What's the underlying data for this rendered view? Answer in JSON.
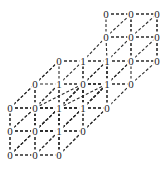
{
  "figure": {
    "kind": "lattice-graph",
    "projection": "oblique",
    "edge_color": "#2b2b2b",
    "node_color": "#1c1c1c",
    "background": "#ffffff",
    "dash_pattern": "3 2"
  },
  "geometry": {
    "origin_x": 10,
    "origin_y": 155,
    "step_x": 24.5,
    "step_y": -47,
    "step_zx": 24.5,
    "step_zy": -23.5,
    "nx": 3,
    "ny": 3,
    "nz": 3
  },
  "chart_data": {
    "type": "scatter",
    "title": "",
    "xlabel": "",
    "ylabel": "",
    "nodes": [
      {
        "id": "n000",
        "label": "0",
        "i": 0,
        "j": 0,
        "k": 0,
        "x": 10,
        "y": 155
      },
      {
        "id": "n100",
        "label": "0",
        "i": 1,
        "j": 0,
        "k": 0,
        "x": 35,
        "y": 155
      },
      {
        "id": "n200",
        "label": "0",
        "i": 2,
        "j": 0,
        "k": 0,
        "x": 59,
        "y": 155
      },
      {
        "id": "n001",
        "label": "0",
        "i": 0,
        "j": 0,
        "k": 1,
        "x": 35,
        "y": 131
      },
      {
        "id": "n101",
        "label": "0",
        "i": 1,
        "j": 0,
        "k": 1,
        "x": 59,
        "y": 131
      },
      {
        "id": "n201",
        "label": "0",
        "i": 2,
        "j": 0,
        "k": 1,
        "x": 83,
        "y": 131
      },
      {
        "id": "n002",
        "label": "0",
        "i": 0,
        "j": 0,
        "k": 2,
        "x": 59,
        "y": 108
      },
      {
        "id": "n102",
        "label": "0",
        "i": 1,
        "j": 0,
        "k": 2,
        "x": 83,
        "y": 108
      },
      {
        "id": "n202",
        "label": "0",
        "i": 2,
        "j": 0,
        "k": 2,
        "x": 107,
        "y": 108
      },
      {
        "id": "n010",
        "label": "0",
        "i": 0,
        "j": 1,
        "k": 0,
        "x": 10,
        "y": 131
      },
      {
        "id": "n110",
        "label": "0",
        "i": 1,
        "j": 1,
        "k": 0,
        "x": 35,
        "y": 131
      },
      {
        "id": "n210",
        "label": "1",
        "i": 2,
        "j": 1,
        "k": 0,
        "x": 59,
        "y": 131
      },
      {
        "id": "n011",
        "label": "0",
        "i": 0,
        "j": 1,
        "k": 1,
        "x": 35,
        "y": 108
      },
      {
        "id": "n111",
        "label": "2",
        "i": 1,
        "j": 1,
        "k": 1,
        "x": 83,
        "y": 84
      },
      {
        "id": "n211",
        "label": "1",
        "i": 2,
        "j": 1,
        "k": 1,
        "x": 83,
        "y": 108
      },
      {
        "id": "n012",
        "label": "0",
        "i": 0,
        "j": 1,
        "k": 2,
        "x": 83,
        "y": 84
      },
      {
        "id": "n112",
        "label": "1",
        "i": 1,
        "j": 1,
        "k": 2,
        "x": 107,
        "y": 84
      },
      {
        "id": "n212",
        "label": "0",
        "i": 2,
        "j": 1,
        "k": 2,
        "x": 131,
        "y": 84
      },
      {
        "id": "n020",
        "label": "0",
        "i": 0,
        "j": 2,
        "k": 0,
        "x": 10,
        "y": 108
      },
      {
        "id": "n120",
        "label": "0",
        "i": 1,
        "j": 2,
        "k": 0,
        "x": 35,
        "y": 108
      },
      {
        "id": "n220",
        "label": "1",
        "i": 2,
        "j": 2,
        "k": 0,
        "x": 59,
        "y": 108
      },
      {
        "id": "n021",
        "label": "0",
        "i": 0,
        "j": 2,
        "k": 1,
        "x": 35,
        "y": 84
      },
      {
        "id": "n121",
        "label": "1",
        "i": 1,
        "j": 2,
        "k": 1,
        "x": 59,
        "y": 84
      },
      {
        "id": "n221",
        "label": "1",
        "i": 2,
        "j": 2,
        "k": 1,
        "x": 107,
        "y": 84
      },
      {
        "id": "n022",
        "label": "0",
        "i": 0,
        "j": 2,
        "k": 2,
        "x": 59,
        "y": 61
      },
      {
        "id": "n122",
        "label": "1",
        "i": 1,
        "j": 2,
        "k": 2,
        "x": 83,
        "y": 61
      },
      {
        "id": "n222",
        "label": "1",
        "i": 2,
        "j": 2,
        "k": 2,
        "x": 107,
        "y": 61
      },
      {
        "id": "nA",
        "label": "0",
        "i": 3,
        "j": 2,
        "k": 2,
        "x": 131,
        "y": 61
      },
      {
        "id": "nB",
        "label": "0",
        "i": 4,
        "j": 2,
        "k": 2,
        "x": 157,
        "y": 61
      },
      {
        "id": "nC",
        "label": "0",
        "i": 3,
        "j": 3,
        "k": 2,
        "x": 106,
        "y": 37
      },
      {
        "id": "nD",
        "label": "0",
        "i": 4,
        "j": 3,
        "k": 2,
        "x": 131,
        "y": 37
      },
      {
        "id": "nE",
        "label": "0",
        "i": 5,
        "j": 3,
        "k": 2,
        "x": 157,
        "y": 37
      },
      {
        "id": "nF",
        "label": "0",
        "i": 3,
        "j": 4,
        "k": 2,
        "x": 106,
        "y": 14
      },
      {
        "id": "nG",
        "label": "0",
        "i": 4,
        "j": 4,
        "k": 2,
        "x": 131,
        "y": 14
      },
      {
        "id": "nH",
        "label": "0",
        "i": 5,
        "j": 4,
        "k": 2,
        "x": 157,
        "y": 14
      }
    ],
    "labels_by_value": {
      "0": 26,
      "1": 8,
      "2": 1
    },
    "edges": [
      [
        "n000",
        "n100"
      ],
      [
        "n100",
        "n200"
      ],
      [
        "n001",
        "n101"
      ],
      [
        "n101",
        "n201"
      ],
      [
        "n002",
        "n102"
      ],
      [
        "n102",
        "n202"
      ],
      [
        "n010",
        "n110"
      ],
      [
        "n110",
        "n210"
      ],
      [
        "n011",
        "n111"
      ],
      [
        "n020",
        "n120"
      ],
      [
        "n120",
        "n220"
      ],
      [
        "n022",
        "n122"
      ],
      [
        "n122",
        "n222"
      ],
      [
        "n222",
        "nA"
      ],
      [
        "nA",
        "nB"
      ],
      [
        "nC",
        "nD"
      ],
      [
        "nD",
        "nE"
      ],
      [
        "nF",
        "nG"
      ],
      [
        "nG",
        "nH"
      ],
      [
        "n000",
        "n010"
      ],
      [
        "n010",
        "n020"
      ],
      [
        "n200",
        "n210"
      ],
      [
        "n210",
        "n220"
      ],
      [
        "n102",
        "n112"
      ],
      [
        "nB",
        "nE"
      ],
      [
        "nE",
        "nH"
      ],
      [
        "nA",
        "nD"
      ],
      [
        "nD",
        "nG"
      ],
      [
        "n000",
        "n001"
      ],
      [
        "n001",
        "n002"
      ],
      [
        "n200",
        "n201"
      ],
      [
        "n201",
        "n202"
      ],
      [
        "n020",
        "n021"
      ],
      [
        "n021",
        "n022"
      ],
      [
        "n220",
        "n221"
      ],
      [
        "n221",
        "n222"
      ]
    ]
  }
}
